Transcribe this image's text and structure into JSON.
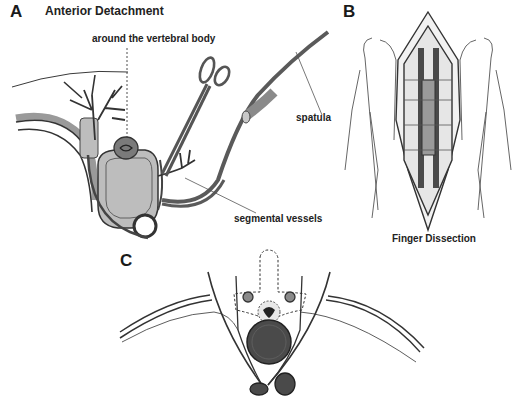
{
  "figure": {
    "panels": [
      {
        "id": "A",
        "letter": "A",
        "title": "Anterior Detachment",
        "annotations": {
          "around": "around the vertebral body",
          "spatula": "spatula",
          "segmental": "segmental vessels"
        }
      },
      {
        "id": "B",
        "letter": "B",
        "caption": "Finger Dissection"
      },
      {
        "id": "C",
        "letter": "C"
      }
    ],
    "colors": {
      "line": "#3a3a3a",
      "vessel": "#4a4a4a",
      "body_fill": "#b8b8b8",
      "dark_fill": "#4d4d4d",
      "mid_fill": "#8a8a8a",
      "light_fill": "#d6d6d6"
    }
  }
}
